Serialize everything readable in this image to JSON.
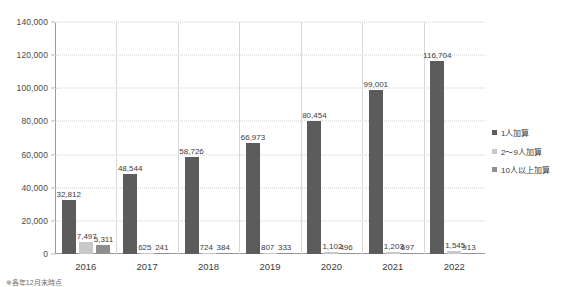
{
  "chart_data": {
    "type": "bar",
    "title": "",
    "subtitle": "",
    "xlabel": "",
    "ylabel": "",
    "categories": [
      "2016",
      "2017",
      "2018",
      "2019",
      "2020",
      "2021",
      "2022"
    ],
    "ylim": [
      0,
      140000
    ],
    "yticks": [
      0,
      20000,
      40000,
      60000,
      80000,
      100000,
      120000,
      140000
    ],
    "ytick_labels": [
      "0",
      "20,000",
      "40,000",
      "60,000",
      "80,000",
      "100,000",
      "120,000",
      "140,000"
    ],
    "grid": true,
    "grid_style": "dotted-horizontal",
    "legend_position": "right",
    "series": [
      {
        "name": "1人加算",
        "color": "#5c5c5c",
        "values": [
          32812,
          48544,
          58726,
          66973,
          80454,
          99001,
          116704
        ],
        "labels": [
          "32,812",
          "48,544",
          "58,726",
          "66,973",
          "80,454",
          "99,001",
          "116,704"
        ]
      },
      {
        "name": "2～9人加算",
        "color": "#c8c8c8",
        "values": [
          7497,
          625,
          724,
          807,
          1102,
          1203,
          1545
        ],
        "labels": [
          "7,497",
          "625",
          "724",
          "807",
          "1,102",
          "1,203",
          "1,545"
        ]
      },
      {
        "name": "10人以上加算",
        "color": "#8f8f8f",
        "values": [
          5311,
          241,
          384,
          333,
          496,
          697,
          913
        ],
        "labels": [
          "5,311",
          "241",
          "384",
          "333",
          "496",
          "697",
          "913"
        ]
      }
    ]
  },
  "legend": {
    "items": [
      {
        "label": "1人加算",
        "color": "#5c5c5c"
      },
      {
        "label": "2～9人加算",
        "color": "#c8c8c8"
      },
      {
        "label": "10人以上加算",
        "color": "#8f8f8f"
      }
    ]
  },
  "footnote": "※各年12月末時点"
}
